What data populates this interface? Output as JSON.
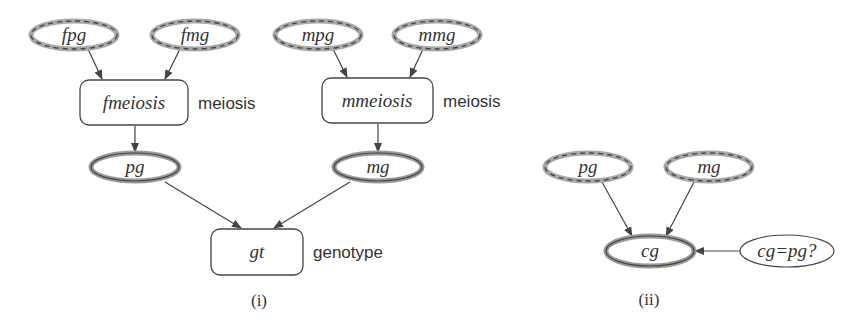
{
  "figure": {
    "panel_i": {
      "caption": "(i)",
      "nodes": {
        "fpg": {
          "label": "fpg",
          "style": "dashed-ellipse"
        },
        "fmg": {
          "label": "fmg",
          "style": "dashed-ellipse"
        },
        "mpg": {
          "label": "mpg",
          "style": "dashed-ellipse"
        },
        "mmg": {
          "label": "mmg",
          "style": "dashed-ellipse"
        },
        "fmeiosis": {
          "label": "fmeiosis",
          "type_label": "meiosis",
          "style": "rounded-box"
        },
        "mmeiosis": {
          "label": "mmeiosis",
          "type_label": "meiosis",
          "style": "rounded-box"
        },
        "pg": {
          "label": "pg",
          "style": "thick-ellipse"
        },
        "mg": {
          "label": "mg",
          "style": "thick-ellipse"
        },
        "gt": {
          "label": "gt",
          "type_label": "genotype",
          "style": "rounded-box"
        }
      },
      "edges": [
        [
          "fpg",
          "fmeiosis"
        ],
        [
          "fmg",
          "fmeiosis"
        ],
        [
          "mpg",
          "mmeiosis"
        ],
        [
          "mmg",
          "mmeiosis"
        ],
        [
          "fmeiosis",
          "pg"
        ],
        [
          "mmeiosis",
          "mg"
        ],
        [
          "pg",
          "gt"
        ],
        [
          "mg",
          "gt"
        ]
      ]
    },
    "panel_ii": {
      "caption": "(ii)",
      "nodes": {
        "pg": {
          "label": "pg",
          "style": "dashed-ellipse"
        },
        "mg": {
          "label": "mg",
          "style": "dashed-ellipse"
        },
        "cg": {
          "label": "cg",
          "style": "thick-ellipse"
        },
        "selector": {
          "label": "cg=pg?",
          "style": "plain-ellipse"
        }
      },
      "edges": [
        [
          "pg",
          "cg"
        ],
        [
          "mg",
          "cg"
        ],
        [
          "selector",
          "cg"
        ]
      ]
    },
    "colors": {
      "stroke": "#444444",
      "halo": "#9a9a9a",
      "text": "#333333"
    }
  }
}
